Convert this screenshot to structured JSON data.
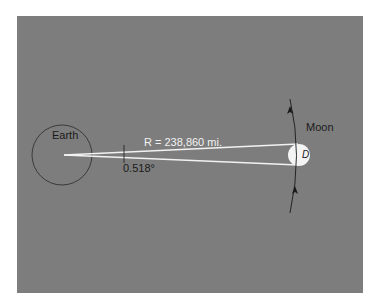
{
  "diagram": {
    "earth_label": "Earth",
    "moon_label": "Moon",
    "distance_label": "R = 238,860 mi.",
    "angle_label": "0.518°",
    "diameter_label": "D",
    "colors": {
      "background": "#7d7d7d",
      "page": "#ffffff",
      "rays": "#f2f2f2",
      "moon": "#f4f4f4",
      "outline": "#2a2a2a"
    }
  }
}
